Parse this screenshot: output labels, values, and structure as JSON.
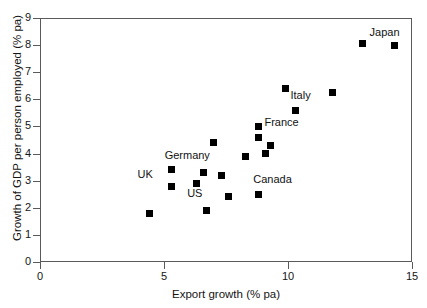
{
  "chart_data": {
    "type": "scatter",
    "title": "",
    "xlabel": "Export growth (% pa)",
    "ylabel": "Growth of GDP per person employed (% pa)",
    "xlim": [
      0,
      15
    ],
    "ylim": [
      0,
      9
    ],
    "xticks": [
      0,
      5,
      10,
      15
    ],
    "yticks": [
      0,
      1,
      2,
      3,
      4,
      5,
      6,
      7,
      8,
      9
    ],
    "grid": false,
    "legend": "none",
    "marker_style": "filled-square",
    "marker_color": "#000000",
    "points": [
      {
        "label": "",
        "x": 4.4,
        "y": 1.8
      },
      {
        "label": "UK",
        "x": 5.3,
        "y": 3.4
      },
      {
        "label": "",
        "x": 5.3,
        "y": 2.8
      },
      {
        "label": "",
        "x": 6.3,
        "y": 2.9
      },
      {
        "label": "US",
        "x": 6.7,
        "y": 1.9
      },
      {
        "label": "",
        "x": 6.6,
        "y": 3.3
      },
      {
        "label": "Germany",
        "x": 7.0,
        "y": 4.4
      },
      {
        "label": "",
        "x": 7.3,
        "y": 3.2
      },
      {
        "label": "",
        "x": 7.6,
        "y": 2.4
      },
      {
        "label": "",
        "x": 8.3,
        "y": 3.9
      },
      {
        "label": "",
        "x": 8.8,
        "y": 5.0
      },
      {
        "label": "France",
        "x": 8.8,
        "y": 4.6
      },
      {
        "label": "",
        "x": 9.3,
        "y": 4.3
      },
      {
        "label": "",
        "x": 9.1,
        "y": 4.0
      },
      {
        "label": "Canada",
        "x": 8.8,
        "y": 2.5
      },
      {
        "label": "Italy",
        "x": 9.9,
        "y": 6.4
      },
      {
        "label": "",
        "x": 10.3,
        "y": 5.6
      },
      {
        "label": "",
        "x": 11.8,
        "y": 6.25
      },
      {
        "label": "",
        "x": 13.0,
        "y": 8.05
      },
      {
        "label": "Japan",
        "x": 14.3,
        "y": 8.0
      }
    ],
    "point_labels": [
      {
        "text": "UK",
        "x": 4.55,
        "y": 3.25,
        "anchor": "end"
      },
      {
        "text": "US",
        "x": 6.55,
        "y": 2.55,
        "anchor": "end"
      },
      {
        "text": "Germany",
        "x": 6.85,
        "y": 3.95,
        "anchor": "end"
      },
      {
        "text": "France",
        "x": 9.05,
        "y": 5.15,
        "anchor": "start"
      },
      {
        "text": "Canada",
        "x": 8.6,
        "y": 3.05,
        "anchor": "start"
      },
      {
        "text": "Italy",
        "x": 10.1,
        "y": 6.15,
        "anchor": "start"
      },
      {
        "text": "Japan",
        "x": 14.5,
        "y": 8.5,
        "anchor": "end"
      }
    ]
  },
  "axis": {
    "x_title": "Export growth (% pa)",
    "y_title": "Growth of GDP per person employed (% pa)",
    "x_tick_labels": [
      "0",
      "5",
      "10",
      "15"
    ],
    "y_tick_labels": [
      "0",
      "1",
      "2",
      "3",
      "4",
      "5",
      "6",
      "7",
      "8",
      "9"
    ]
  }
}
